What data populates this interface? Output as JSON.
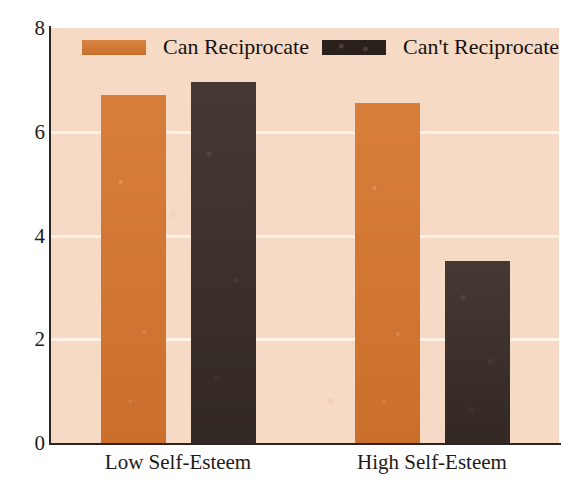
{
  "chart_data": {
    "type": "bar",
    "title": "",
    "subtitle": "",
    "xlabel": "",
    "ylabel": "",
    "categories": [
      "Low Self-Esteem",
      "High Self-Esteem"
    ],
    "series": [
      {
        "name": "Can Reciprocate",
        "color": "#d5762e",
        "values": [
          6.7,
          6.55
        ]
      },
      {
        "name": "Can't Reciprocate",
        "color": "#3a2e28",
        "values": [
          6.95,
          3.5
        ]
      }
    ],
    "ylim": [
      0,
      8
    ],
    "yticks": [
      0,
      2,
      4,
      6,
      8
    ],
    "ytick_labels": [
      "0",
      "2",
      "4",
      "6",
      "8"
    ],
    "grid": true,
    "gridlines_at": [
      2,
      4,
      6
    ],
    "legend_position": "top-inside",
    "plot_background": "#f7dac6",
    "axis_color": "#2c2420",
    "gridline_color": "#fdf1e6"
  }
}
